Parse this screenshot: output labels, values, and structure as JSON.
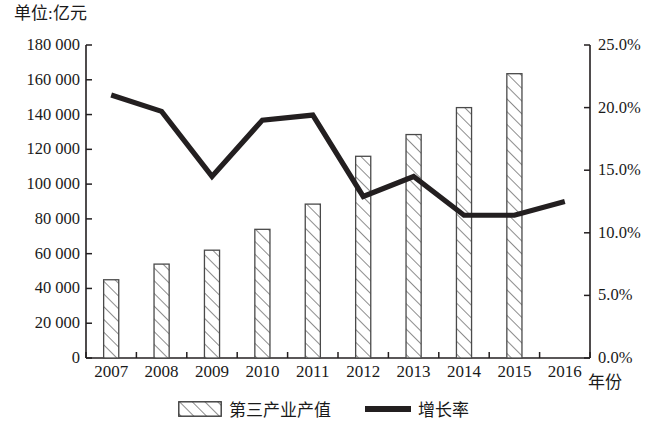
{
  "chart_data": {
    "type": "bar",
    "title": "",
    "unit_label": "单位:亿元",
    "xlabel": "年份",
    "categories": [
      "2007",
      "2008",
      "2009",
      "2010",
      "2011",
      "2012",
      "2013",
      "2014",
      "2015",
      "2016"
    ],
    "series": [
      {
        "name": "第三产业产值",
        "type": "bar",
        "axis": "left",
        "unit": "亿元",
        "values": [
          45000,
          54000,
          62000,
          74000,
          88500,
          116000,
          128500,
          144000,
          163500,
          0
        ]
      },
      {
        "name": "增长率",
        "type": "line",
        "axis": "right",
        "unit": "%",
        "values": [
          21.0,
          19.7,
          14.5,
          19.0,
          19.4,
          12.9,
          14.5,
          11.4,
          11.4,
          12.5
        ]
      }
    ],
    "bar_values": [
      45000,
      54000,
      62000,
      74000,
      88500,
      116000,
      128500,
      144000,
      163500
    ],
    "line_values": [
      21.0,
      19.7,
      14.5,
      19.0,
      19.4,
      12.9,
      14.5,
      11.4,
      11.4,
      12.5
    ],
    "ylim_left": [
      0,
      180000
    ],
    "ylim_right": [
      0,
      25.0
    ],
    "ytick_labels_left": [
      "180 000",
      "160 000",
      "140 000",
      "120 000",
      "100 000",
      "80 000",
      "60 000",
      "40 000",
      "20 000",
      "0"
    ],
    "ytick_values_left": [
      180000,
      160000,
      140000,
      120000,
      100000,
      80000,
      60000,
      40000,
      20000,
      0
    ],
    "ytick_labels_right": [
      "25.0%",
      "20.0%",
      "15.0%",
      "10.0%",
      "5.0%",
      "0.0%"
    ],
    "ytick_values_right": [
      25.0,
      20.0,
      15.0,
      10.0,
      5.0,
      0.0
    ],
    "grid": false,
    "legend_position": "bottom",
    "legend": [
      {
        "label": "第三产业产值",
        "marker": "hatched-bar"
      },
      {
        "label": "增长率",
        "marker": "solid-line"
      }
    ],
    "colors": {
      "axis": "#231f20",
      "line": "#231f20",
      "bar_stroke": "#4a4a4a",
      "bar_fill": "#ffffff",
      "hatch": "#6b6b6b",
      "background": "#ffffff"
    }
  }
}
